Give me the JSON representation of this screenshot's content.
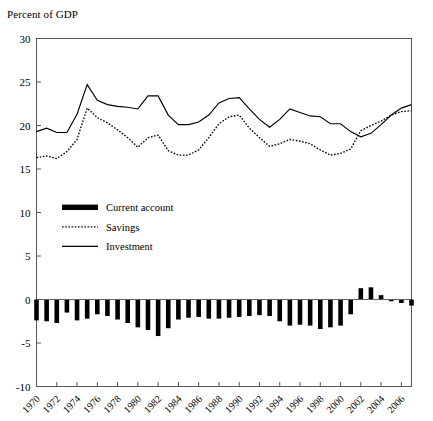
{
  "axis_label": "Percent of GDP",
  "legend": {
    "items": [
      {
        "key": "current_account",
        "label": "Current account",
        "style": "thick-bar",
        "color": "#000000"
      },
      {
        "key": "savings",
        "label": "Savings",
        "style": "dotted-line",
        "color": "#000000"
      },
      {
        "key": "investment",
        "label": "Investment",
        "style": "solid-line",
        "color": "#000000"
      }
    ]
  },
  "chart_data": {
    "type": "line",
    "title": "",
    "subtitle": "",
    "xlabel": "",
    "ylabel": "Percent of GDP",
    "ylim": [
      -10,
      30
    ],
    "yticks": [
      -10,
      -5,
      0,
      5,
      10,
      15,
      20,
      25,
      30
    ],
    "ytick_labels": [
      "-10",
      "-5",
      "0",
      "5",
      "10",
      "15",
      "20",
      "25",
      "30"
    ],
    "xlim": [
      1970,
      2007
    ],
    "xticks": [
      1970,
      1972,
      1974,
      1976,
      1978,
      1980,
      1982,
      1984,
      1986,
      1988,
      1990,
      1992,
      1994,
      1996,
      1998,
      2000,
      2002,
      2004,
      2006
    ],
    "xtick_labels": [
      "1970",
      "1972",
      "1974",
      "1976",
      "1978",
      "1980",
      "1982",
      "1984",
      "1986",
      "1988",
      "1990",
      "1992",
      "1994",
      "1996",
      "1998",
      "2000",
      "2002",
      "2004",
      "2006"
    ],
    "xtick_rotation": -45,
    "grid": false,
    "legend_position": "inside-left",
    "x": [
      1970,
      1971,
      1972,
      1973,
      1974,
      1975,
      1976,
      1977,
      1978,
      1979,
      1980,
      1981,
      1982,
      1983,
      1984,
      1985,
      1986,
      1987,
      1988,
      1989,
      1990,
      1991,
      1992,
      1993,
      1994,
      1995,
      1996,
      1997,
      1998,
      1999,
      2000,
      2001,
      2002,
      2003,
      2004,
      2005,
      2006,
      2007
    ],
    "series": [
      {
        "name": "Investment",
        "style": "solid-line",
        "color": "#000000",
        "values": [
          19.3,
          19.7,
          19.2,
          19.2,
          21.3,
          24.7,
          22.9,
          22.4,
          22.2,
          22.1,
          21.9,
          23.4,
          23.4,
          21.2,
          20.1,
          20.1,
          20.4,
          21.2,
          22.6,
          23.1,
          23.2,
          21.9,
          20.7,
          19.8,
          20.7,
          21.9,
          21.5,
          21.1,
          21.0,
          20.2,
          20.2,
          19.3,
          18.7,
          19.1,
          20.1,
          21.2,
          22.0,
          22.4
        ]
      },
      {
        "name": "Savings",
        "style": "dotted-line",
        "color": "#000000",
        "values": [
          16.3,
          16.5,
          16.2,
          17.0,
          18.4,
          22.0,
          20.9,
          20.3,
          19.5,
          18.6,
          17.5,
          18.6,
          18.9,
          17.1,
          16.6,
          16.6,
          17.2,
          18.6,
          20.2,
          21.0,
          21.2,
          19.7,
          18.6,
          17.6,
          17.9,
          18.4,
          18.2,
          17.9,
          17.2,
          16.6,
          16.8,
          17.3,
          19.4,
          20.0,
          20.5,
          21.2,
          21.6,
          21.7
        ]
      },
      {
        "name": "Current account",
        "style": "bars",
        "color": "#000000",
        "values": [
          -2.4,
          -2.5,
          -2.7,
          -1.5,
          -2.4,
          -2.2,
          -1.7,
          -1.9,
          -2.3,
          -2.7,
          -3.2,
          -3.5,
          -4.2,
          -3.3,
          -2.3,
          -2.1,
          -2.0,
          -2.2,
          -2.2,
          -2.1,
          -2.0,
          -1.9,
          -1.8,
          -1.9,
          -2.5,
          -3.0,
          -2.9,
          -3.0,
          -3.4,
          -3.2,
          -3.0,
          -1.7,
          1.3,
          1.4,
          0.5,
          -0.2,
          -0.4,
          -0.7
        ]
      }
    ]
  }
}
